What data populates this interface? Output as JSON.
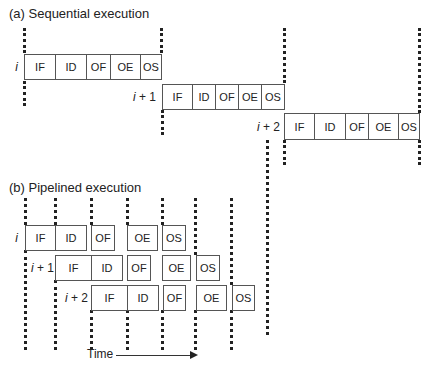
{
  "sequential": {
    "title": "(a) Sequential execution",
    "rows": [
      {
        "label_var": "i",
        "label_suffix": "",
        "stages": [
          "IF",
          "ID",
          "OF",
          "OE",
          "OS"
        ]
      },
      {
        "label_var": "i",
        "label_suffix": " + 1",
        "stages": [
          "IF",
          "ID",
          "OF",
          "OE",
          "OS"
        ]
      },
      {
        "label_var": "i",
        "label_suffix": " + 2",
        "stages": [
          "IF",
          "ID",
          "OF",
          "OE",
          "OS"
        ]
      }
    ]
  },
  "pipelined": {
    "title": "(b) Pipelined execution",
    "rows": [
      {
        "label_var": "i",
        "label_suffix": "",
        "stages": [
          "IF",
          "ID",
          "OF",
          "OE",
          "OS"
        ]
      },
      {
        "label_var": "i",
        "label_suffix": " + 1",
        "stages": [
          "IF",
          "ID",
          "OF",
          "OE",
          "OS"
        ]
      },
      {
        "label_var": "i",
        "label_suffix": " + 2",
        "stages": [
          "IF",
          "ID",
          "OF",
          "OE",
          "OS"
        ]
      }
    ]
  },
  "time_label": "Time"
}
